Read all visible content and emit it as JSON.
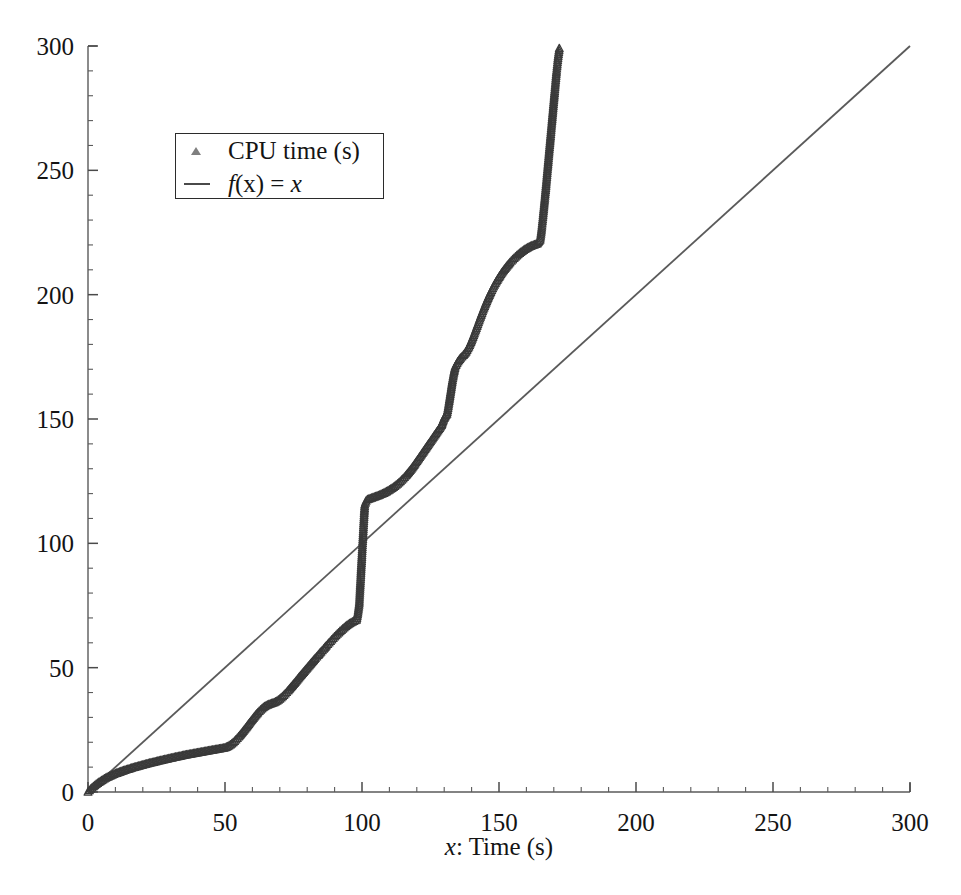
{
  "chart_data": {
    "type": "scatter",
    "title": "",
    "xlabel": "x: Time (s)",
    "ylabel": "",
    "xlim": [
      0,
      300
    ],
    "ylim": [
      0,
      300
    ],
    "xticks": [
      0,
      50,
      100,
      150,
      200,
      250,
      300
    ],
    "yticks": [
      0,
      50,
      100,
      150,
      200,
      250,
      300
    ],
    "xtick_labels": [
      "0",
      "50",
      "100",
      "150",
      "200",
      "250",
      "300"
    ],
    "ytick_labels": [
      "0",
      "50",
      "100",
      "150",
      "200",
      "250",
      "300"
    ],
    "minor_tick_step": 10,
    "grid": false,
    "legend_position": "upper left",
    "series": [
      {
        "name": "CPU time (s)",
        "type": "scatter",
        "marker": "triangle-up",
        "color": "#3a3a3a",
        "x": [
          0,
          1,
          2,
          3,
          4,
          5,
          6,
          7,
          8,
          9,
          10,
          11,
          12,
          13,
          14,
          15,
          16,
          17,
          18,
          19,
          20,
          21,
          22,
          23,
          24,
          25,
          26,
          27,
          28,
          29,
          30,
          31,
          32,
          33,
          34,
          35,
          36,
          37,
          38,
          39,
          40,
          41,
          42,
          43,
          44,
          45,
          46,
          47,
          48,
          49,
          50,
          51,
          52,
          53,
          54,
          55,
          56,
          57,
          58,
          59,
          60,
          61,
          62,
          63,
          64,
          65,
          66,
          67,
          68,
          69,
          70,
          71,
          72,
          73,
          74,
          75,
          76,
          77,
          78,
          79,
          80,
          81,
          82,
          83,
          84,
          85,
          86,
          87,
          88,
          89,
          90,
          91,
          92,
          93,
          94,
          95,
          96,
          97,
          98,
          98.5,
          99,
          99.2,
          99.4,
          99.6,
          99.8,
          100,
          100.2,
          100.4,
          100.6,
          100.8,
          101,
          101.5,
          102,
          103,
          104,
          105,
          106,
          107,
          108,
          109,
          110,
          111,
          112,
          113,
          114,
          115,
          116,
          117,
          118,
          119,
          120,
          121,
          122,
          123,
          124,
          125,
          126,
          127,
          128,
          129,
          129.5,
          130,
          130.5,
          131,
          131.5,
          132,
          132.5,
          133,
          133.5,
          134,
          135,
          136,
          137,
          138,
          139,
          140,
          141,
          142,
          143,
          144,
          145,
          146,
          147,
          148,
          149,
          150,
          151,
          152,
          153,
          154,
          155,
          156,
          157,
          158,
          159,
          160,
          161,
          162,
          163,
          164,
          165,
          165.5,
          166,
          166.5,
          167,
          167.5,
          168,
          168.5,
          169,
          169.5,
          170,
          170.5,
          171,
          171.5,
          172
        ],
        "y": [
          0,
          1.2,
          2.2,
          3.1,
          3.9,
          4.6,
          5.3,
          5.9,
          6.4,
          6.9,
          7.4,
          7.8,
          8.2,
          8.6,
          9.0,
          9.3,
          9.7,
          10.0,
          10.3,
          10.6,
          10.9,
          11.2,
          11.5,
          11.8,
          12.0,
          12.3,
          12.6,
          12.8,
          13.1,
          13.3,
          13.6,
          13.8,
          14.1,
          14.3,
          14.5,
          14.8,
          15.0,
          15.2,
          15.4,
          15.6,
          15.8,
          16.0,
          16.2,
          16.4,
          16.6,
          16.8,
          17.0,
          17.2,
          17.4,
          17.6,
          17.8,
          18.3,
          19.0,
          19.9,
          21.0,
          22.2,
          23.5,
          24.9,
          26.3,
          27.8,
          29.2,
          30.6,
          31.9,
          33.0,
          34.0,
          34.7,
          35.2,
          35.6,
          36.0,
          36.6,
          37.4,
          38.4,
          39.5,
          40.7,
          42.0,
          43.3,
          44.6,
          46.0,
          47.3,
          48.6,
          49.9,
          51.2,
          52.5,
          53.8,
          55.0,
          56.3,
          57.5,
          58.8,
          60.0,
          61.2,
          62.4,
          63.5,
          64.6,
          65.6,
          66.6,
          67.4,
          68.1,
          68.7,
          69.2,
          72.0,
          76.0,
          80.0,
          84.0,
          88.0,
          92.0,
          96.0,
          100.0,
          104.0,
          108.0,
          112.0,
          115.5,
          117.0,
          117.6,
          118.0,
          118.4,
          118.8,
          119.2,
          119.7,
          120.2,
          120.8,
          121.5,
          122.2,
          123.0,
          123.9,
          124.9,
          126.0,
          127.2,
          128.5,
          129.9,
          131.4,
          133.0,
          134.6,
          136.2,
          137.8,
          139.4,
          141.0,
          142.6,
          144.2,
          145.8,
          147.4,
          149.0,
          150.3,
          151.3,
          152.0,
          155.0,
          158.5,
          162.0,
          165.5,
          168.5,
          171.0,
          173.0,
          174.5,
          175.6,
          177.0,
          179.0,
          181.5,
          184.3,
          187.3,
          190.3,
          193.2,
          196.0,
          198.6,
          201.0,
          203.2,
          205.2,
          207.0,
          208.7,
          210.2,
          211.6,
          212.9,
          214.1,
          215.2,
          216.2,
          217.1,
          217.9,
          218.6,
          219.2,
          219.7,
          220.1,
          220.5,
          222.0,
          226.0,
          231.0,
          236.5,
          242.0,
          248.0,
          254.0,
          260.0,
          266.0,
          272.0,
          278.0,
          284.0,
          290.0,
          295.0,
          299.0
        ]
      },
      {
        "name": "f(x) = x",
        "type": "line",
        "color": "#5a5a5a",
        "x": [
          0,
          300
        ],
        "y": [
          0,
          300
        ]
      }
    ]
  },
  "legend": {
    "items": [
      {
        "label": "CPU time (s)",
        "key": "triangle-marker"
      },
      {
        "label_prefix": "f",
        "label_arg": "(x) = ",
        "label_suffix": "x",
        "key": "line-swatch"
      }
    ]
  },
  "axes": {
    "x_title_prefix": "x",
    "x_title_rest": ": Time (s)"
  }
}
